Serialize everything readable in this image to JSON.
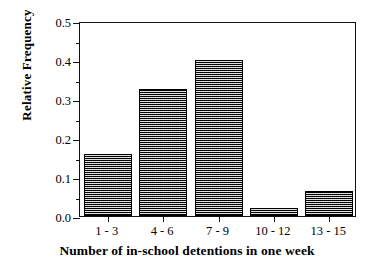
{
  "chart_data": {
    "type": "bar",
    "title": "",
    "xlabel": "Number of in-school detentions in one week",
    "ylabel": "Relative Frequency",
    "categories": [
      "1 - 3",
      "4 - 6",
      "7 - 9",
      "10 - 12",
      "13 - 15"
    ],
    "values": [
      0.16,
      0.325,
      0.4,
      0.02,
      0.065
    ],
    "ylim": [
      0.0,
      0.5
    ],
    "ytick_labels": [
      "0.0",
      "0.1",
      "0.2",
      "0.3",
      "0.4",
      "0.5"
    ],
    "ytick_values": [
      0.0,
      0.1,
      0.2,
      0.3,
      0.4,
      0.5
    ],
    "yminor_values": [
      0.05,
      0.15,
      0.25,
      0.35,
      0.45
    ],
    "grid": false,
    "legend": false,
    "bar_fill_color": "#4a4a4a",
    "bar_edge_color": "#000000",
    "axis_color": "#111111",
    "background_color": "#ffffff"
  }
}
